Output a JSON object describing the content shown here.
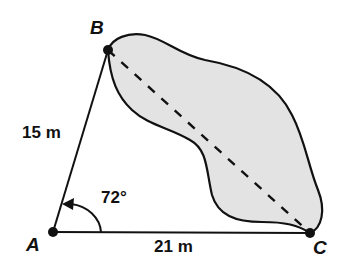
{
  "diagram": {
    "type": "geometry-triangle-with-lake",
    "points": [
      {
        "id": "A",
        "label": "A",
        "x": 53,
        "y": 232
      },
      {
        "id": "B",
        "label": "B",
        "x": 108,
        "y": 50
      },
      {
        "id": "C",
        "label": "C",
        "x": 310,
        "y": 233
      }
    ],
    "sides": [
      {
        "from": "A",
        "to": "B",
        "label": "15 m",
        "style": "solid"
      },
      {
        "from": "A",
        "to": "C",
        "label": "21 m",
        "style": "solid"
      },
      {
        "from": "B",
        "to": "C",
        "label": "",
        "style": "dashed"
      }
    ],
    "angle": {
      "vertex": "A",
      "label": "72",
      "unit": "°"
    },
    "region": {
      "description": "shaded lake region spanning B to C",
      "fill": "#e3e3e3",
      "stroke": "#111111"
    },
    "colors": {
      "line": "#111111",
      "fill": "#e3e3e3",
      "background": "#ffffff"
    }
  },
  "labels": {
    "point_a": "A",
    "point_b": "B",
    "point_c": "C",
    "side_ab": "15 m",
    "side_ac": "21 m",
    "angle_a": "72°"
  }
}
